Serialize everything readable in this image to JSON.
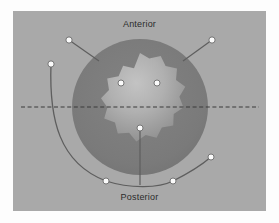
{
  "figure": {
    "kind": "anatomical-cross-section-diagram",
    "labels": {
      "anterior": "Anterior",
      "posterior": "Posterior"
    },
    "colors": {
      "page_background": "#fdfdfd",
      "panel_background": "#a9a9a9",
      "outer_disc": "#7c7c7c",
      "inner_star_light": "#b7b7b7",
      "inner_star_dark": "#8d8d8d",
      "marker_fill": "#fbfbfb",
      "marker_stroke": "#6b6b6b",
      "leader_line": "#5e5e5e",
      "axis_dashed_line": "#3a3a3a",
      "label_text": "#2b2b2b"
    },
    "geometry": {
      "panel": {
        "x": 13,
        "y": 11,
        "width": 253,
        "height": 200
      },
      "outer_disc": {
        "cx": 127,
        "cy": 96,
        "r": 68
      },
      "inner_star": {
        "cx": 127,
        "cy": 96,
        "outer_r": 54,
        "inner_r": 42,
        "points": 12
      },
      "dashed_axis": {
        "y": 96,
        "x1": 8,
        "x2": 246
      }
    },
    "markers": [
      {
        "id": "marker-anterior-left",
        "x": 56,
        "y": 29,
        "region": "outside-upper-left"
      },
      {
        "id": "marker-anterior-right",
        "x": 199,
        "y": 29,
        "region": "outside-upper-right"
      },
      {
        "id": "marker-lateral-left",
        "x": 38,
        "y": 53,
        "region": "outside-left"
      },
      {
        "id": "marker-core-anterior-left",
        "x": 108,
        "y": 72,
        "region": "inner-star"
      },
      {
        "id": "marker-core-anterior-right",
        "x": 144,
        "y": 72,
        "region": "inner-star"
      },
      {
        "id": "marker-core-posterior",
        "x": 127,
        "y": 117,
        "region": "inner-star"
      },
      {
        "id": "marker-posterior-left",
        "x": 93,
        "y": 170,
        "region": "outside-lower-left"
      },
      {
        "id": "marker-posterior-right",
        "x": 160,
        "y": 170,
        "region": "outside-lower-right"
      },
      {
        "id": "marker-lateral-right",
        "x": 198,
        "y": 146,
        "region": "outside-lower-right"
      }
    ],
    "leaders": [
      {
        "id": "leader-anterior-left",
        "from": "marker-anterior-left",
        "type": "straight"
      },
      {
        "id": "leader-anterior-right",
        "from": "marker-anterior-right",
        "type": "straight"
      },
      {
        "id": "leader-lateral-left",
        "from": "marker-lateral-left",
        "type": "curve"
      },
      {
        "id": "leader-posterior-arc",
        "from": "marker-lateral-right",
        "type": "arc"
      },
      {
        "id": "leader-core-posterior",
        "from": "marker-core-posterior",
        "type": "straight-vertical"
      }
    ]
  }
}
